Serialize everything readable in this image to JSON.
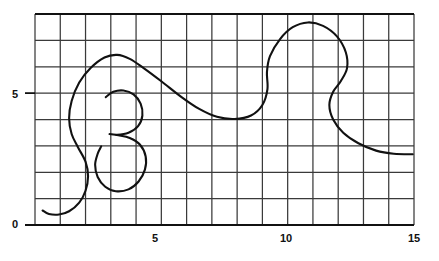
{
  "figure": {
    "background_color": "#ffffff",
    "line_color": "#111111",
    "grid_color": "#3a3a3a",
    "axis_color": "#111111"
  },
  "axes": {
    "x_labels": [
      "0",
      "5",
      "10",
      "15"
    ],
    "y_labels": [
      "0",
      "5"
    ],
    "x_label_5": "5",
    "x_label_10": "10",
    "x_label_15": "15",
    "y_label_0": "0",
    "y_label_5": "5"
  },
  "chart_data": {
    "type": "line",
    "title": "",
    "xlabel": "",
    "ylabel": "",
    "xlim": [
      0,
      15
    ],
    "ylim": [
      0,
      8
    ],
    "grid": true,
    "legend": "none",
    "xticks": [
      0,
      5,
      10,
      15
    ],
    "yticks": [
      0,
      5
    ],
    "xtick_labels": [
      "0",
      "5",
      "10",
      "15"
    ],
    "ytick_labels": [
      "0",
      "5"
    ],
    "grid_x_lines": [
      0,
      1,
      2,
      3,
      4,
      5,
      6,
      7,
      8,
      9,
      10,
      11,
      12,
      13,
      14,
      15
    ],
    "grid_y_lines": [
      0,
      1,
      2,
      3,
      4,
      5,
      6,
      7,
      8
    ],
    "series": [
      {
        "name": "freehand-curve",
        "closed": false,
        "points": [
          [
            0.3,
            0.55
          ],
          [
            0.55,
            0.42
          ],
          [
            0.95,
            0.4
          ],
          [
            1.35,
            0.52
          ],
          [
            1.75,
            0.85
          ],
          [
            2.0,
            1.3
          ],
          [
            2.1,
            1.85
          ],
          [
            2.0,
            2.4
          ],
          [
            1.7,
            2.95
          ],
          [
            1.45,
            3.45
          ],
          [
            1.35,
            4.05
          ],
          [
            1.45,
            4.7
          ],
          [
            1.75,
            5.4
          ],
          [
            2.2,
            5.95
          ],
          [
            2.75,
            6.35
          ],
          [
            3.25,
            6.45
          ],
          [
            3.75,
            6.3
          ],
          [
            4.3,
            5.95
          ],
          [
            5.0,
            5.45
          ],
          [
            5.8,
            4.85
          ],
          [
            6.5,
            4.4
          ],
          [
            7.2,
            4.1
          ],
          [
            7.9,
            4.02
          ],
          [
            8.55,
            4.15
          ],
          [
            9.0,
            4.55
          ],
          [
            9.2,
            5.15
          ],
          [
            9.18,
            5.8
          ],
          [
            9.3,
            6.4
          ],
          [
            9.7,
            7.05
          ],
          [
            10.2,
            7.5
          ],
          [
            10.8,
            7.68
          ],
          [
            11.4,
            7.55
          ],
          [
            11.95,
            7.15
          ],
          [
            12.3,
            6.55
          ],
          [
            12.35,
            5.95
          ],
          [
            12.1,
            5.45
          ],
          [
            11.8,
            5.05
          ],
          [
            11.65,
            4.55
          ],
          [
            11.8,
            4.0
          ],
          [
            12.2,
            3.5
          ],
          [
            12.8,
            3.1
          ],
          [
            13.5,
            2.82
          ],
          [
            14.2,
            2.7
          ],
          [
            14.95,
            2.68
          ]
        ],
        "inner_loop": {
          "name": "three-shape",
          "points": [
            [
              2.8,
              4.85
            ],
            [
              3.1,
              5.05
            ],
            [
              3.5,
              5.1
            ],
            [
              3.9,
              4.95
            ],
            [
              4.18,
              4.6
            ],
            [
              4.25,
              4.15
            ],
            [
              4.08,
              3.75
            ],
            [
              3.7,
              3.5
            ],
            [
              3.25,
              3.42
            ],
            [
              2.95,
              3.45
            ],
            [
              3.3,
              3.4
            ],
            [
              3.75,
              3.3
            ],
            [
              4.15,
              3.05
            ],
            [
              4.38,
              2.6
            ],
            [
              4.35,
              2.1
            ],
            [
              4.1,
              1.65
            ],
            [
              3.7,
              1.35
            ],
            [
              3.2,
              1.28
            ],
            [
              2.78,
              1.45
            ],
            [
              2.48,
              1.82
            ],
            [
              2.38,
              2.28
            ],
            [
              2.48,
              2.7
            ],
            [
              2.62,
              2.98
            ]
          ]
        }
      }
    ]
  }
}
